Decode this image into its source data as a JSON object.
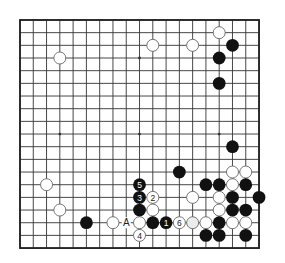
{
  "board": {
    "size": 19,
    "origin": {
      "x": 20,
      "y": 20
    },
    "spacing": {
      "x": 13.28,
      "y": 12.67
    },
    "colors": {
      "background": "#ffffff",
      "line": "#333333",
      "border": "#222222",
      "black_stone": "#111111",
      "white_stone": "#ffffff",
      "white_stone_outline": "#666666",
      "grey_stone": "#ececec",
      "label_on_black": "#ffffff",
      "label_on_white": "#222222"
    },
    "star_points": [
      [
        3,
        3
      ],
      [
        9,
        3
      ],
      [
        15,
        3
      ],
      [
        3,
        9
      ],
      [
        9,
        9
      ],
      [
        15,
        9
      ]
    ],
    "stones": [
      {
        "color": "white",
        "col": 15,
        "row": 1
      },
      {
        "color": "white",
        "col": 10,
        "row": 2
      },
      {
        "color": "white",
        "col": 13,
        "row": 2
      },
      {
        "color": "black",
        "col": 16,
        "row": 2
      },
      {
        "color": "white",
        "col": 3,
        "row": 3
      },
      {
        "color": "black",
        "col": 15,
        "row": 3
      },
      {
        "color": "black",
        "col": 15,
        "row": 5
      },
      {
        "color": "black",
        "col": 16,
        "row": 10
      },
      {
        "color": "black",
        "col": 12,
        "row": 12
      },
      {
        "color": "white",
        "col": 16,
        "row": 12
      },
      {
        "color": "white",
        "col": 17,
        "row": 12
      },
      {
        "color": "white",
        "col": 2,
        "row": 13
      },
      {
        "color": "black",
        "col": 9,
        "row": 13,
        "label": "5"
      },
      {
        "color": "black",
        "col": 14,
        "row": 13
      },
      {
        "color": "black",
        "col": 15,
        "row": 13
      },
      {
        "color": "white",
        "col": 16,
        "row": 13
      },
      {
        "color": "black",
        "col": 17,
        "row": 13
      },
      {
        "color": "black",
        "col": 9,
        "row": 14,
        "label": "3"
      },
      {
        "color": "white",
        "col": 10,
        "row": 14,
        "label": "2"
      },
      {
        "color": "white",
        "col": 13,
        "row": 14
      },
      {
        "color": "white",
        "col": 15,
        "row": 14
      },
      {
        "color": "black",
        "col": 16,
        "row": 14
      },
      {
        "color": "black",
        "col": 18,
        "row": 14
      },
      {
        "color": "white",
        "col": 3,
        "row": 15
      },
      {
        "color": "black",
        "col": 9,
        "row": 15
      },
      {
        "color": "white",
        "col": 10,
        "row": 15
      },
      {
        "color": "white",
        "col": 15,
        "row": 15
      },
      {
        "color": "black",
        "col": 16,
        "row": 15
      },
      {
        "color": "black",
        "col": 17,
        "row": 15
      },
      {
        "color": "black",
        "col": 5,
        "row": 16
      },
      {
        "color": "white",
        "col": 7,
        "row": 16
      },
      {
        "color": "white",
        "col": 9,
        "row": 16
      },
      {
        "color": "black",
        "col": 10,
        "row": 16
      },
      {
        "color": "black",
        "col": 11,
        "row": 16,
        "label": "1"
      },
      {
        "color": "white",
        "col": 12,
        "row": 16,
        "label": "6"
      },
      {
        "color": "grey",
        "col": 13,
        "row": 16
      },
      {
        "color": "white",
        "col": 14,
        "row": 16
      },
      {
        "color": "black",
        "col": 15,
        "row": 16
      },
      {
        "color": "white",
        "col": 16,
        "row": 16
      },
      {
        "color": "white",
        "col": 17,
        "row": 16
      },
      {
        "color": "white",
        "col": 9,
        "row": 17,
        "label": "4"
      },
      {
        "color": "black",
        "col": 14,
        "row": 17
      },
      {
        "color": "black",
        "col": 15,
        "row": 17
      },
      {
        "color": "black",
        "col": 17,
        "row": 17
      }
    ],
    "markers": [
      {
        "type": "letter",
        "text": "A",
        "col": 8,
        "row": 16
      }
    ]
  }
}
